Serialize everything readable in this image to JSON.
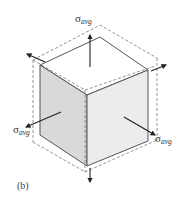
{
  "figure": {
    "caption": "(b)",
    "stress_symbol": "σ",
    "stress_subscript": "avg",
    "labels": [
      {
        "id": "top",
        "symbol": "σ",
        "subscript": "avg"
      },
      {
        "id": "left",
        "symbol": "σ",
        "subscript": "avg"
      },
      {
        "id": "right",
        "symbol": "σ",
        "subscript": "avg"
      }
    ],
    "colors": {
      "left_face": "#d9d9d9",
      "right_face": "#ececec",
      "top_face": "#ffffff",
      "edge": "#555555",
      "dashed": "#777777",
      "arrow": "#222222"
    }
  }
}
